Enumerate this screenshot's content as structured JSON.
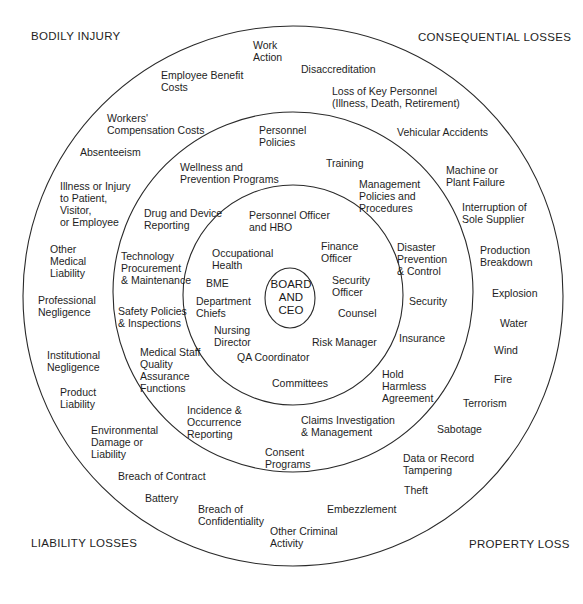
{
  "corners": {
    "top_left": "BODILY INJURY",
    "top_right": "CONSEQUENTIAL LOSSES",
    "bottom_left": "LIABILITY LOSSES",
    "bottom_right": "PROPERTY LOSS"
  },
  "center": {
    "label": "BOARD\nAND\nCEO"
  },
  "inner_ring": [
    "Personnel Officer\nand HBO",
    "Occupational\nHealth",
    "Finance\nOfficer",
    "BME",
    "Security\nOfficer",
    "Department\nChiefs",
    "Counsel",
    "Nursing\nDirector",
    "Risk Manager",
    "QA Coordinator",
    "Committees"
  ],
  "middle_ring": [
    "Personnel\nPolicies",
    "Training",
    "Wellness and\nPrevention Programs",
    "Management\nPolicies and\nProcedures",
    "Drug and Device\nReporting",
    "Disaster\nPrevention\n& Control",
    "Technology\nProcurement\n& Maintenance",
    "Security",
    "Safety Policies\n& Inspections",
    "Insurance",
    "Medical Staff\nQuality\nAssurance\nFunctions",
    "Hold\nHarmless\nAgreement",
    "Incidence &\nOccurrence\nReporting",
    "Claims Investigation\n& Management",
    "Consent\nPrograms"
  ],
  "outer_ring": [
    "Work\nAction",
    "Employee Benefit\nCosts",
    "Disaccreditation",
    "Loss of Key Personnel\n(Illness, Death, Retirement)",
    "Workers'\nCompensation Costs",
    "Vehicular Accidents",
    "Absenteeism",
    "Machine or\nPlant Failure",
    "Illness or Injury\nto Patient,\nVisitor,\nor Employee",
    "Interruption of\nSole Supplier",
    "Other\nMedical\nLiability",
    "Production\nBreakdown",
    "Professional\nNegligence",
    "Explosion",
    "Water",
    "Institutional\nNegligence",
    "Wind",
    "Product\nLiability",
    "Fire",
    "Terrorism",
    "Environmental\nDamage or\nLiability",
    "Sabotage",
    "Breach of Contract",
    "Data or Record\nTampering",
    "Battery",
    "Theft",
    "Breach of\nConfidentiality",
    "Embezzlement",
    "Other Criminal\nActivity"
  ],
  "colors": {
    "line": "#2a2a2a",
    "text": "#1e1e1e",
    "background": "#ffffff"
  }
}
